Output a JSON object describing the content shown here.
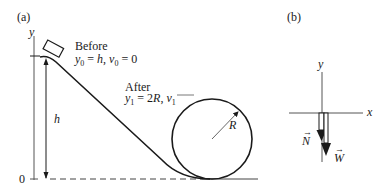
{
  "panel_a": {
    "label": "(a)",
    "y_axis_label": "y",
    "zero_label": "0",
    "height_label": "h",
    "before": {
      "title": "Before",
      "y_var": "y",
      "y_sub": "0",
      "y_eq": " = ",
      "y_val": "h",
      "sep": ", ",
      "v_var": "v",
      "v_sub": "0",
      "v_eq": " = 0"
    },
    "after": {
      "title": "After",
      "y_var": "y",
      "y_sub": "1",
      "y_eq": " = 2",
      "y_val": "R",
      "sep": ", ",
      "v_var": "v",
      "v_sub": "1"
    },
    "radius_label": "R"
  },
  "panel_b": {
    "label": "(b)",
    "y_axis_label": "y",
    "x_axis_label": "x",
    "normal_force_label": "N",
    "weight_label": "W"
  },
  "colors": {
    "ink": "#1a1a1a",
    "axis": "#555555",
    "background": "#ffffff"
  }
}
